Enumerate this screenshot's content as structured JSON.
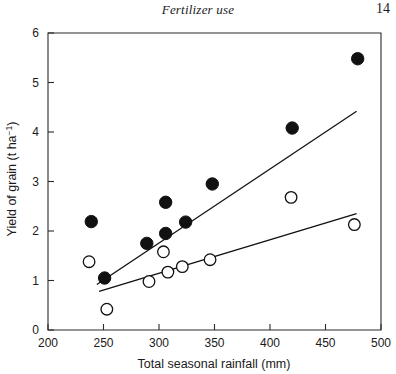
{
  "header": {
    "title": "Fertilizer use",
    "page_number": "14"
  },
  "chart_data": {
    "type": "scatter",
    "title": "",
    "xlabel": "Total seasonal rainfall (mm)",
    "ylabel": "Yield of grain (t ha⁻¹)",
    "ylabel_main": "Yield of grain (t ha",
    "ylabel_sup": "−1",
    "ylabel_tail": ")",
    "xlim": [
      200,
      500
    ],
    "ylim": [
      0,
      6
    ],
    "xticks": [
      200,
      250,
      300,
      350,
      400,
      450,
      500
    ],
    "xtick_labels": [
      "200",
      "250",
      "300",
      "350",
      "400",
      "450",
      "500"
    ],
    "yticks": [
      0,
      1,
      2,
      3,
      4,
      5,
      6
    ],
    "ytick_labels": [
      "0",
      "1",
      "2",
      "3",
      "4",
      "5",
      "6"
    ],
    "grid": false,
    "legend_position": "none",
    "series": [
      {
        "name": "fertilized",
        "marker": "filled-circle",
        "color": "#111111",
        "points": [
          [
            239,
            2.19
          ],
          [
            251,
            1.05
          ],
          [
            289,
            1.75
          ],
          [
            306,
            1.95
          ],
          [
            306,
            2.58
          ],
          [
            324,
            2.18
          ],
          [
            348,
            2.95
          ],
          [
            420,
            4.08
          ],
          [
            479,
            5.48
          ]
        ],
        "fit_line": {
          "x_start": 244,
          "y_start": 0.92,
          "x_end": 478,
          "y_end": 4.42
        }
      },
      {
        "name": "unfertilized",
        "marker": "open-circle",
        "color": "#111111",
        "points": [
          [
            237,
            1.38
          ],
          [
            253,
            0.42
          ],
          [
            291,
            0.98
          ],
          [
            304,
            1.58
          ],
          [
            308,
            1.17
          ],
          [
            321,
            1.28
          ],
          [
            346,
            1.42
          ],
          [
            419,
            2.68
          ],
          [
            476,
            2.13
          ]
        ],
        "fit_line": {
          "x_start": 246,
          "y_start": 0.78,
          "x_end": 478,
          "y_end": 2.35
        }
      }
    ]
  }
}
